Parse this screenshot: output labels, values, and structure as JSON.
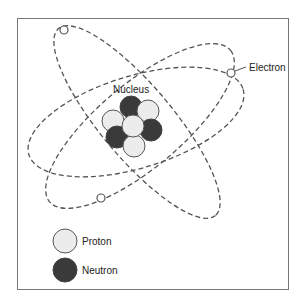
{
  "diagram": {
    "type": "atom-model",
    "labels": {
      "nucleus": "Nucleus",
      "electron": "Electron"
    },
    "legend": [
      {
        "key": "proton",
        "label": "Proton",
        "color": "#ececec"
      },
      {
        "key": "neutron",
        "label": "Neutron",
        "color": "#3a3a3a"
      }
    ],
    "nucleus_particles": [
      {
        "type": "neutron",
        "x": 131,
        "y": 107
      },
      {
        "type": "proton",
        "x": 148,
        "y": 111
      },
      {
        "type": "proton",
        "x": 113,
        "y": 121
      },
      {
        "type": "neutron",
        "x": 151,
        "y": 130
      },
      {
        "type": "neutron",
        "x": 117,
        "y": 137
      },
      {
        "type": "proton",
        "x": 134,
        "y": 146
      },
      {
        "type": "proton",
        "x": 133,
        "y": 126
      }
    ],
    "orbits": 3,
    "electrons": 3,
    "colors": {
      "stroke": "#555555",
      "proton_fill": "#ececec",
      "neutron_fill": "#3a3a3a",
      "frame": "#777777"
    }
  }
}
